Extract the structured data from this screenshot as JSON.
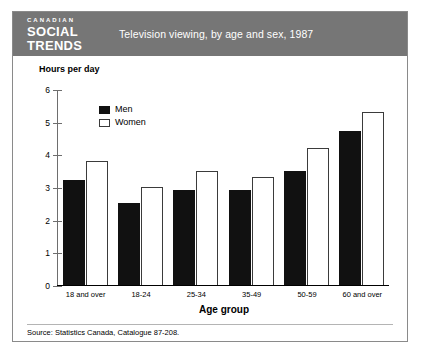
{
  "masthead": {
    "line1": "CANADIAN",
    "line2": "SOCIAL",
    "line3": "TRENDS"
  },
  "header": {
    "title": "Television viewing, by age and sex, 1987",
    "band_color": "#767676",
    "text_color": "#ffffff"
  },
  "source": {
    "note": "Source: Statistics Canada, Catalogue 87-208."
  },
  "chart_data": {
    "type": "bar",
    "title": "Television viewing, by age and sex, 1987",
    "xlabel": "Age group",
    "ylabel": "Hours per day",
    "categories": [
      "18 and over",
      "18-24",
      "25-34",
      "35-49",
      "50-59",
      "60 and over"
    ],
    "series": [
      {
        "name": "Men",
        "color": "#111111",
        "values": [
          3.2,
          2.5,
          2.9,
          2.9,
          3.5,
          4.7
        ]
      },
      {
        "name": "Women",
        "color": "#ffffff",
        "values": [
          3.8,
          3.0,
          3.5,
          3.3,
          4.2,
          5.3
        ]
      }
    ],
    "ylim": [
      0,
      6
    ],
    "yticks": [
      0,
      1,
      2,
      3,
      4,
      5,
      6
    ],
    "ytick_labels": [
      "0",
      "1",
      "2",
      "3",
      "4",
      "5",
      "6"
    ],
    "grid": false,
    "legend_position": "top-left-inside"
  }
}
